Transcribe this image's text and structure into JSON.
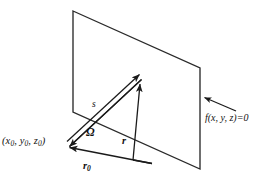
{
  "figure": {
    "type": "geometry-diagram",
    "background_color": "#ffffff",
    "line_color": "#1a1a1a",
    "width": 274,
    "height": 184,
    "labels": {
      "source_point": "(x0, y0, z0)",
      "source_point_base": "(x",
      "surface_equation": "f(x, y, z)=0",
      "path_vector": "s",
      "angle": "Ω",
      "position_vector": "r",
      "source_vector": "r0",
      "source_vector_base": "r",
      "subscript_zero": "0"
    },
    "point_label_parts": {
      "open": "(",
      "x": "x",
      "x_sub": "0",
      "comma1": ", ",
      "y": "y",
      "y_sub": "0",
      "comma2": ", ",
      "z": "z",
      "z_sub": "0",
      "close": ")"
    },
    "geometry": {
      "plane_corners": [
        [
          73,
          11
        ],
        [
          200,
          68
        ],
        [
          200,
          169
        ],
        [
          73,
          112
        ]
      ],
      "source_point_xy": [
        67,
        144
      ],
      "surface_hit_point_xy": [
        140,
        79
      ],
      "vector_origin_xy": [
        133,
        160
      ],
      "arrow_s": {
        "from": [
          67,
          144
        ],
        "to": [
          140,
          76
        ],
        "double_headed": true
      },
      "arrow_r": {
        "from": [
          133,
          160
        ],
        "to": [
          140,
          85
        ],
        "double_headed": false
      },
      "arrow_r0": {
        "from": [
          152,
          163
        ],
        "to": [
          68,
          147
        ],
        "double_headed": false
      },
      "arrow_callout": {
        "from": [
          237,
          112
        ],
        "to": [
          205,
          98
        ]
      }
    }
  }
}
